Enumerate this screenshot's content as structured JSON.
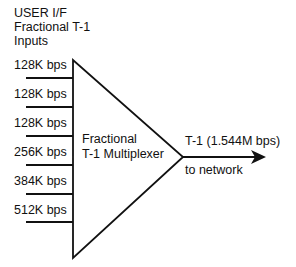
{
  "header": {
    "line1": "USER I/F",
    "line2": "Fractional T-1",
    "line3": "Inputs"
  },
  "inputs": [
    {
      "label": "128K bps"
    },
    {
      "label": "128K bps"
    },
    {
      "label": "128K bps"
    },
    {
      "label": "256K bps"
    },
    {
      "label": "384K bps"
    },
    {
      "label": "512K bps"
    }
  ],
  "multiplexer": {
    "line1": "Fractional",
    "line2": "T-1 Multiplexer"
  },
  "output": {
    "label": "T-1 (1.544M bps)",
    "destination": "to network"
  },
  "colors": {
    "stroke": "#111111",
    "background": "#ffffff"
  }
}
